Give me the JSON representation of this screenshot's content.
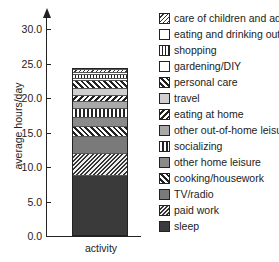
{
  "chart_data": {
    "type": "bar",
    "stacked": true,
    "title": "",
    "xlabel": "activity",
    "ylabel": "average hours/day",
    "ylim": [
      0,
      32
    ],
    "yticks": [
      "0.0",
      "5.0",
      "10.0",
      "15.0",
      "20.0",
      "25.0",
      "30.0"
    ],
    "grid": false,
    "legend_position": "right",
    "categories": [
      "activity"
    ],
    "series": [
      {
        "name": "sleep",
        "values": [
          8.8
        ],
        "pattern": "p-sleep"
      },
      {
        "name": "paid work",
        "values": [
          3.2
        ],
        "pattern": "p-paid"
      },
      {
        "name": "TV/radio",
        "values": [
          2.5
        ],
        "pattern": "p-tv"
      },
      {
        "name": "cooking/housework",
        "values": [
          1.5
        ],
        "pattern": "p-back"
      },
      {
        "name": "other home leisure",
        "values": [
          1.3
        ],
        "pattern": "p-dgrey"
      },
      {
        "name": "socializing",
        "values": [
          1.3
        ],
        "pattern": "p-vbar"
      },
      {
        "name": "other out-of-home leisure",
        "values": [
          1.0
        ],
        "pattern": "p-mgrey"
      },
      {
        "name": "eating at home",
        "values": [
          1.0
        ],
        "pattern": "p-fwd"
      },
      {
        "name": "travel",
        "values": [
          0.9
        ],
        "pattern": "p-lgrey"
      },
      {
        "name": "personal care",
        "values": [
          1.3
        ],
        "pattern": "p-back"
      },
      {
        "name": "gardening/DIY",
        "values": [
          0.3
        ],
        "pattern": "p-white"
      },
      {
        "name": "shopping",
        "values": [
          0.5
        ],
        "pattern": "p-vthin"
      },
      {
        "name": "eating and drinking out",
        "values": [
          0.3
        ],
        "pattern": "p-white"
      },
      {
        "name": "care of children and adults",
        "values": [
          0.4
        ],
        "pattern": "p-care"
      }
    ]
  },
  "legend": [
    "care of children and adults",
    "eating and drinking out",
    "shopping",
    "gardening/DIY",
    "personal care",
    "travel",
    "eating at home",
    "other out-of-home leisure",
    "socializing",
    "other home leisure",
    "cooking/housework",
    "TV/radio",
    "paid work",
    "sleep"
  ]
}
